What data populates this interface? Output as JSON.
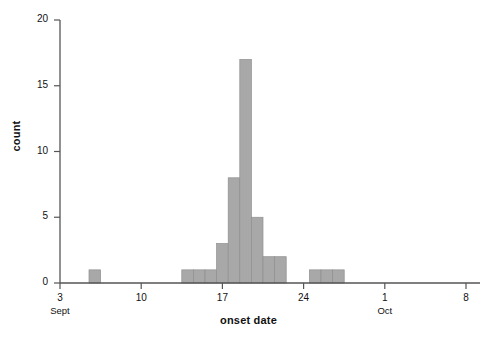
{
  "chart_data": {
    "type": "bar",
    "title": "",
    "subtitle": "",
    "xlabel": "onset date",
    "ylabel": "count",
    "ylim": [
      0,
      20
    ],
    "xlim_days": [
      2,
      41
    ],
    "grid": false,
    "legend": null,
    "bar_color": "#a8a8a8",
    "bar_edge_color": "#8f8f8f",
    "axis_color": "#555555",
    "bin_width_days": 1,
    "x_axis": {
      "ticks": [
        {
          "day": 3,
          "label": "3",
          "month": "Sept"
        },
        {
          "day": 10,
          "label": "10",
          "month": ""
        },
        {
          "day": 17,
          "label": "17",
          "month": ""
        },
        {
          "day": 24,
          "label": "24",
          "month": ""
        },
        {
          "day": 31,
          "label": "1",
          "month": "Oct"
        },
        {
          "day": 38,
          "label": "8",
          "month": ""
        }
      ]
    },
    "y_axis": {
      "ticks": [
        {
          "value": 0,
          "label": "0"
        },
        {
          "value": 5,
          "label": "5"
        },
        {
          "value": 10,
          "label": "10"
        },
        {
          "value": 15,
          "label": "15"
        },
        {
          "value": 20,
          "label": "20"
        }
      ]
    },
    "categories": [
      "Sept 6",
      "Sept 14",
      "Sept 15",
      "Sept 16",
      "Sept 17",
      "Sept 18",
      "Sept 19",
      "Sept 20",
      "Sept 21",
      "Sept 22",
      "Sept 25",
      "Sept 26",
      "Sept 27"
    ],
    "bars": [
      {
        "day": 6,
        "value": 1
      },
      {
        "day": 14,
        "value": 1
      },
      {
        "day": 15,
        "value": 1
      },
      {
        "day": 16,
        "value": 1
      },
      {
        "day": 17,
        "value": 3
      },
      {
        "day": 18,
        "value": 8
      },
      {
        "day": 19,
        "value": 17
      },
      {
        "day": 20,
        "value": 5
      },
      {
        "day": 21,
        "value": 2
      },
      {
        "day": 22,
        "value": 2
      },
      {
        "day": 25,
        "value": 1
      },
      {
        "day": 26,
        "value": 1
      },
      {
        "day": 27,
        "value": 1
      }
    ],
    "values": [
      1,
      1,
      1,
      1,
      3,
      8,
      17,
      5,
      2,
      2,
      1,
      1,
      1
    ],
    "total_count": 34
  }
}
